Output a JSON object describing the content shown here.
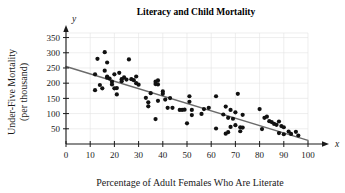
{
  "chart_data": {
    "type": "scatter",
    "title": "Literacy and Child Mortality",
    "xlabel": "Percentage of Adult Females Who Are Literate",
    "ylabel": "Under-Five Mortality\n(per thousand)",
    "ylabel_line1": "Under-Five Mortality",
    "ylabel_line2": "(per thousand)",
    "x_axis_name": "x",
    "y_axis_name": "y",
    "xlim": [
      0,
      100
    ],
    "ylim": [
      0,
      365
    ],
    "xticks": [
      0,
      10,
      20,
      30,
      40,
      50,
      60,
      70,
      80,
      90,
      100
    ],
    "xtick_labels": [
      "0",
      "10",
      "20",
      "30",
      "40",
      "50",
      "60",
      "70",
      "80",
      "90",
      "100"
    ],
    "yticks": [
      50,
      100,
      150,
      200,
      250,
      300,
      350
    ],
    "ytick_labels": [
      "50",
      "100",
      "150",
      "200",
      "250",
      "300",
      "350"
    ],
    "grid": true,
    "legend": null,
    "point_color": "#111111",
    "trend_line_color": "#6b6b6b",
    "trend_line": {
      "type": "linear-fit",
      "x_start": 0,
      "y_start": 255,
      "x_end": 100,
      "y_end": 12
    },
    "points": [
      [
        12,
        229
      ],
      [
        12,
        177
      ],
      [
        13,
        280
      ],
      [
        14,
        194
      ],
      [
        15,
        183
      ],
      [
        16,
        302
      ],
      [
        16,
        241
      ],
      [
        17,
        222
      ],
      [
        17,
        218
      ],
      [
        17,
        268
      ],
      [
        18,
        215
      ],
      [
        19,
        205
      ],
      [
        19,
        196
      ],
      [
        20,
        229
      ],
      [
        20,
        183
      ],
      [
        21,
        163
      ],
      [
        21,
        184
      ],
      [
        22,
        234
      ],
      [
        23,
        213
      ],
      [
        23,
        206
      ],
      [
        24,
        219
      ],
      [
        25,
        212
      ],
      [
        26,
        278
      ],
      [
        27,
        213
      ],
      [
        28,
        210
      ],
      [
        29,
        222
      ],
      [
        29,
        200
      ],
      [
        30,
        195
      ],
      [
        33,
        152
      ],
      [
        34,
        137
      ],
      [
        34,
        124
      ],
      [
        35,
        167
      ],
      [
        37,
        205
      ],
      [
        37,
        197
      ],
      [
        37,
        82
      ],
      [
        38,
        209
      ],
      [
        38,
        196
      ],
      [
        38,
        142
      ],
      [
        40,
        173
      ],
      [
        40,
        165
      ],
      [
        41,
        146
      ],
      [
        42,
        119
      ],
      [
        43,
        151
      ],
      [
        44,
        119
      ],
      [
        47,
        112
      ],
      [
        48,
        112
      ],
      [
        49,
        113
      ],
      [
        50,
        68
      ],
      [
        51,
        157
      ],
      [
        51,
        139
      ],
      [
        52,
        95
      ],
      [
        52,
        112
      ],
      [
        56,
        99
      ],
      [
        57,
        115
      ],
      [
        59,
        119
      ],
      [
        62,
        157
      ],
      [
        62,
        51
      ],
      [
        65,
        97
      ],
      [
        66,
        123
      ],
      [
        66,
        34
      ],
      [
        67,
        86
      ],
      [
        67,
        39
      ],
      [
        68,
        112
      ],
      [
        68,
        56
      ],
      [
        69,
        83
      ],
      [
        70,
        104
      ],
      [
        70,
        62
      ],
      [
        71,
        165
      ],
      [
        72,
        42
      ],
      [
        72,
        55
      ],
      [
        73,
        96
      ],
      [
        73,
        54
      ],
      [
        80,
        115
      ],
      [
        81,
        49
      ],
      [
        82,
        86
      ],
      [
        83,
        90
      ],
      [
        84,
        75
      ],
      [
        85,
        72
      ],
      [
        86,
        66
      ],
      [
        87,
        63
      ],
      [
        88,
        74
      ],
      [
        88,
        36
      ],
      [
        89,
        59
      ],
      [
        90,
        55
      ],
      [
        90,
        32
      ],
      [
        92,
        41
      ],
      [
        93,
        33
      ],
      [
        95,
        40
      ],
      [
        96,
        28
      ]
    ]
  }
}
